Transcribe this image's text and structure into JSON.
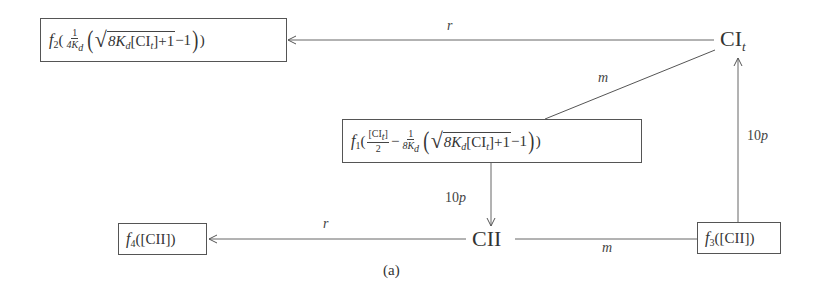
{
  "diagram": {
    "caption": "(a)",
    "nodes": {
      "cit": {
        "main": "CI",
        "sub": "t"
      },
      "cii": {
        "main": "CII"
      }
    },
    "boxes": {
      "f2": {
        "fname": "f",
        "fsub": "2",
        "open": "(",
        "frac_num": "1",
        "frac_den_a": "4K",
        "frac_den_sub": "d",
        "sqrt_a": "8K",
        "sqrt_sub": "d",
        "sqrt_b": "[CI",
        "sqrt_sub2": "t",
        "sqrt_c": "]+1",
        "minus_one": "−1",
        "close": ")"
      },
      "f1": {
        "fname": "f",
        "fsub": "1",
        "open": "(",
        "frac1_num_a": "[CI",
        "frac1_num_sub": "t",
        "frac1_num_b": "]",
        "frac1_den": "2",
        "minus": "−",
        "frac2_num": "1",
        "frac2_den_a": "8K",
        "frac2_den_sub": "d",
        "sqrt_a": "8K",
        "sqrt_sub": "d",
        "sqrt_b": "[CI",
        "sqrt_sub2": "t",
        "sqrt_c": "]+1",
        "minus_one": "−1",
        "close": ")"
      },
      "f3": {
        "fname": "f",
        "fsub": "3",
        "arg": "([CII])"
      },
      "f4": {
        "fname": "f",
        "fsub": "4",
        "arg": "([CII])"
      }
    },
    "edges": {
      "cit_to_f2": {
        "label": "r"
      },
      "cit_to_f1": {
        "label": "m"
      },
      "f1_to_cii": {
        "label_num": "10",
        "label_var": "p"
      },
      "cii_to_f4": {
        "label": "r"
      },
      "cii_to_f3": {
        "label": "m"
      },
      "f3_to_cit": {
        "label_num": "10",
        "label_var": "p"
      }
    },
    "colors": {
      "line": "#555555",
      "text": "#333333",
      "background": "#ffffff"
    }
  }
}
